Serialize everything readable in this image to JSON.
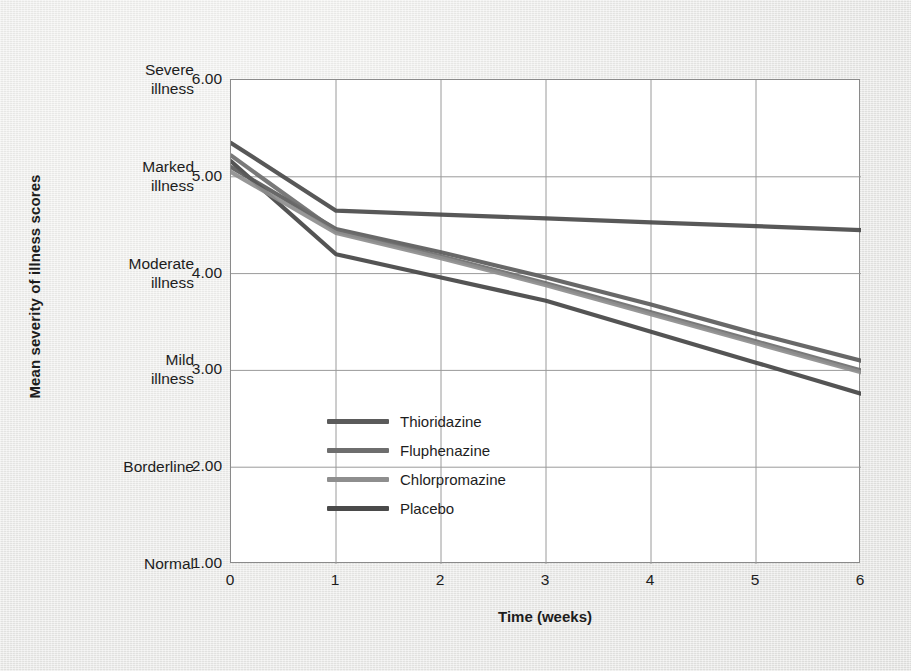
{
  "chart_data": {
    "type": "line",
    "title": "",
    "subtitle": "",
    "xlabel": "Time (weeks)",
    "ylabel": "Mean severity of illness scores",
    "x": [
      0,
      1,
      2,
      3,
      4,
      5,
      6
    ],
    "xlim": [
      0,
      6
    ],
    "ylim": [
      1.0,
      6.0
    ],
    "xticks": [
      "0",
      "1",
      "2",
      "3",
      "4",
      "5",
      "6"
    ],
    "yticks": [
      "1.00",
      "2.00",
      "3.00",
      "4.00",
      "5.00",
      "6.00"
    ],
    "ytick_categories": [
      {
        "value": "6.00",
        "label_line1": "Severe",
        "label_line2": "illness"
      },
      {
        "value": "5.00",
        "label_line1": "Marked",
        "label_line2": "illness"
      },
      {
        "value": "4.00",
        "label_line1": "Moderate",
        "label_line2": "illness"
      },
      {
        "value": "3.00",
        "label_line1": "Mild",
        "label_line2": "illness"
      },
      {
        "value": "2.00",
        "label_line1": "Borderline",
        "label_line2": ""
      },
      {
        "value": "1.00",
        "label_line1": "Normal",
        "label_line2": ""
      }
    ],
    "grid": true,
    "grid_color": "#9a9a9a",
    "legend_position": "center-left-inside",
    "series": [
      {
        "name": "Thioridazine",
        "color": "#5b5b5b",
        "values": [
          5.1,
          4.46,
          4.22,
          3.96,
          3.68,
          3.38,
          3.1
        ]
      },
      {
        "name": "Fluphenazine",
        "color": "#6e6e6e",
        "values": [
          5.22,
          4.44,
          4.18,
          3.9,
          3.6,
          3.3,
          3.0
        ]
      },
      {
        "name": "Chlorpromazine",
        "color": "#8e8e8e",
        "values": [
          5.05,
          4.42,
          4.16,
          3.88,
          3.58,
          3.28,
          2.98
        ]
      },
      {
        "name": "Placebo",
        "color": "#4a4a4a",
        "values": [
          5.35,
          4.65,
          4.61,
          4.57,
          4.53,
          4.49,
          4.45
        ]
      }
    ],
    "extra_line": {
      "name": "Thioridazine-low",
      "color": "#454545",
      "values": [
        5.16,
        4.2,
        3.96,
        3.72,
        3.4,
        3.08,
        2.76
      ]
    }
  },
  "legend": {
    "items": [
      {
        "label": "Thioridazine",
        "color": "#5b5b5b"
      },
      {
        "label": "Fluphenazine",
        "color": "#6e6e6e"
      },
      {
        "label": "Chlorpromazine",
        "color": "#8e8e8e"
      },
      {
        "label": "Placebo",
        "color": "#4a4a4a"
      }
    ]
  },
  "axes": {
    "x_title": "Time (weeks)",
    "y_title": "Mean severity of illness scores"
  }
}
